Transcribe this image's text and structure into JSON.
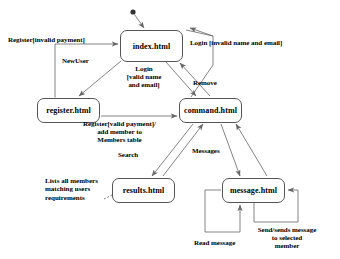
{
  "diagram": {
    "type": "uml-state-diagram",
    "colors": {
      "stroke": "#555555",
      "text": "#000000",
      "background": "#ffffff"
    },
    "initial_state_marker": "filled-circle",
    "nodes": [
      {
        "id": "index",
        "label": "index.html",
        "x": 120,
        "y": 30,
        "w": 63,
        "h": 32
      },
      {
        "id": "register",
        "label": "register.html",
        "x": 37,
        "y": 98,
        "w": 63,
        "h": 25
      },
      {
        "id": "command",
        "label": "command.html",
        "x": 179,
        "y": 98,
        "w": 63,
        "h": 25
      },
      {
        "id": "results",
        "label": "results.html",
        "x": 112,
        "y": 178,
        "w": 63,
        "h": 25
      },
      {
        "id": "message",
        "label": "message.html",
        "x": 222,
        "y": 178,
        "w": 63,
        "h": 25
      }
    ],
    "edge_labels": [
      {
        "id": "register-invalid",
        "text": "Register[invalid payment]",
        "x": 8,
        "y": 36,
        "align": "lft"
      },
      {
        "id": "login-invalid",
        "text": "Login [invalid name and email]",
        "x": 190,
        "y": 39,
        "align": "lft"
      },
      {
        "id": "new-user",
        "text": "NewUser",
        "x": 62,
        "y": 57,
        "align": "lft"
      },
      {
        "id": "login-valid",
        "text": "Login\n[valid name\nand email]",
        "x": 118,
        "y": 65,
        "align": "ctr"
      },
      {
        "id": "remove",
        "text": "Remove",
        "x": 193,
        "y": 79,
        "align": "lft"
      },
      {
        "id": "register-valid",
        "text": "Register[valid payment]/\nadd member to\nMembers table",
        "x": 62,
        "y": 120,
        "align": "ctr"
      },
      {
        "id": "search",
        "text": "Search",
        "x": 118,
        "y": 151,
        "align": "lft"
      },
      {
        "id": "messages",
        "text": "Messages",
        "x": 192,
        "y": 147,
        "align": "lft"
      },
      {
        "id": "read-message",
        "text": "Read message",
        "x": 194,
        "y": 239,
        "align": "lft"
      },
      {
        "id": "send-message",
        "text": "Send/sends message\nto selected\nmember",
        "x": 242,
        "y": 226,
        "align": "ctr"
      }
    ],
    "notes": [
      {
        "id": "results-note",
        "text": "Lists all members\nmatching users\nrequirements",
        "x": 45,
        "y": 177
      }
    ],
    "transitions": [
      {
        "from": "start",
        "to": "index",
        "label": ""
      },
      {
        "from": "register",
        "to": "index",
        "label": "Register[invalid payment]"
      },
      {
        "from": "index",
        "to": "register",
        "label": "NewUser"
      },
      {
        "from": "index",
        "to": "command",
        "label": "Login [valid name and email]"
      },
      {
        "from": "command",
        "to": "index",
        "label": "Login [invalid name and email]"
      },
      {
        "from": "command",
        "to": "index",
        "label": "Remove"
      },
      {
        "from": "register",
        "to": "command",
        "label": "Register[valid payment]/ add member to Members table"
      },
      {
        "from": "command",
        "to": "results",
        "label": "Search"
      },
      {
        "from": "results",
        "to": "command",
        "label": ""
      },
      {
        "from": "command",
        "to": "message",
        "label": "Messages"
      },
      {
        "from": "message",
        "to": "command",
        "label": ""
      },
      {
        "from": "message",
        "to": "message",
        "label": "Read message"
      },
      {
        "from": "message",
        "to": "message",
        "label": "Send/sends message to selected member"
      }
    ]
  }
}
